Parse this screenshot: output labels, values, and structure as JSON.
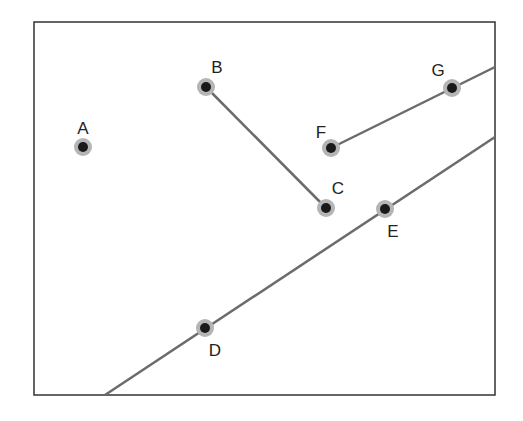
{
  "diagram": {
    "frame": {
      "x": 34,
      "y": 22,
      "width": 461,
      "height": 373,
      "stroke": "#333333"
    },
    "colors": {
      "line": "#6b6b6b",
      "point_fill": "#1a1a1a",
      "point_halo": "#b5b5b5",
      "label": "#222222"
    },
    "points": [
      {
        "id": "A",
        "label": "A",
        "x": 83,
        "y": 147,
        "lx": 83,
        "ly": 134
      },
      {
        "id": "B",
        "label": "B",
        "x": 206,
        "y": 87,
        "lx": 217,
        "ly": 73
      },
      {
        "id": "C",
        "label": "C",
        "x": 326,
        "y": 208,
        "lx": 338,
        "ly": 194
      },
      {
        "id": "D",
        "label": "D",
        "x": 205,
        "y": 328,
        "lx": 215,
        "ly": 356
      },
      {
        "id": "E",
        "label": "E",
        "x": 385,
        "y": 209,
        "lx": 393,
        "ly": 237
      },
      {
        "id": "F",
        "label": "F",
        "x": 331,
        "y": 148,
        "lx": 321,
        "ly": 138
      },
      {
        "id": "G",
        "label": "G",
        "x": 452,
        "y": 88,
        "lx": 438,
        "ly": 76
      }
    ],
    "segments": [
      {
        "id": "segment-BC",
        "x1": 206,
        "y1": 87,
        "x2": 326,
        "y2": 208
      },
      {
        "id": "ray-FG",
        "x1": 331,
        "y1": 148,
        "x2": 495,
        "y2": 67
      },
      {
        "id": "line-DE",
        "x1": 105,
        "y1": 395,
        "x2": 495,
        "y2": 137
      }
    ]
  }
}
